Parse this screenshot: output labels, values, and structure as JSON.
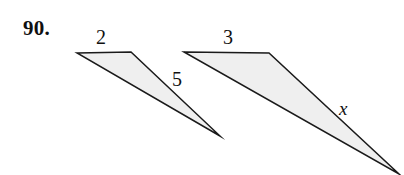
{
  "figure": {
    "problem_number": "90.",
    "background_color": "#ffffff",
    "stroke_color": "#1a1a1a",
    "fill_color": "#efefef",
    "triangles": [
      {
        "name": "left-triangle",
        "points": "77,53 131,52 220,136",
        "labels": [
          {
            "name": "top-side",
            "text": "2"
          },
          {
            "name": "hypotenuse-side",
            "text": "5"
          }
        ]
      },
      {
        "name": "right-triangle",
        "points": "184,52 269,53 399,174",
        "labels": [
          {
            "name": "top-side",
            "text": "3"
          },
          {
            "name": "hypotenuse-side",
            "text": "x"
          }
        ]
      }
    ],
    "labels": {
      "side_2": "2",
      "side_5": "5",
      "side_3": "3",
      "side_x": "x"
    }
  }
}
